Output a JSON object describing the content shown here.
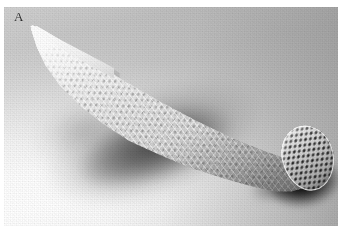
{
  "figure": {
    "panel_label": "A",
    "caption": "",
    "modality": "grayscale photograph"
  },
  "photo": {
    "alt_text": "Grayscale photograph of an elongated conical woven mesh structure with hexagonal honeycomb cells, tapering to a sharp point at the upper left and opening into a hollow tube at the lower right, resting on a light surface with a soft cast shadow.",
    "colors": {
      "background_light": "#ffffff",
      "background_mid": "#c9c9c9",
      "background_dark": "#b0b0b0",
      "object_highlight": "#ffffff",
      "object_midtone": "#d2d2d2",
      "object_shadow": "#b2b2b2",
      "cell_hole": "#282828",
      "contact_shadow": "#0a0a0a",
      "label_color": "#2b2b2b"
    },
    "features": [
      {
        "name": "sharp-tip",
        "description": "solid tapered point at upper left"
      },
      {
        "name": "lattice-body",
        "description": "honeycomb woven cell wall along the cone"
      },
      {
        "name": "open-end",
        "description": "hollow tubular opening at right showing dark cells"
      },
      {
        "name": "cast-shadow",
        "description": "blurred diffuse shadow below and left of object"
      }
    ]
  }
}
